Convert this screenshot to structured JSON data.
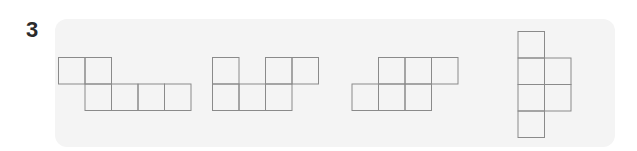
{
  "question": {
    "number": "3"
  },
  "colors": {
    "panel_background": "#f4f4f4",
    "cell_stroke": "#8a8a8a",
    "number_text": "#2b2b2b"
  },
  "cell_size": 26.5,
  "nets": [
    {
      "id": "net-1",
      "cells": [
        [
          0,
          0
        ],
        [
          1,
          0
        ],
        [
          1,
          1
        ],
        [
          2,
          1
        ],
        [
          3,
          1
        ],
        [
          4,
          1
        ]
      ],
      "origin": [
        58,
        57
      ]
    },
    {
      "id": "net-2",
      "cells": [
        [
          0,
          0
        ],
        [
          2,
          0
        ],
        [
          3,
          0
        ],
        [
          0,
          1
        ],
        [
          1,
          1
        ],
        [
          2,
          1
        ]
      ],
      "origin": [
        212,
        57
      ]
    },
    {
      "id": "net-3",
      "cells": [
        [
          1,
          0
        ],
        [
          2,
          0
        ],
        [
          3,
          0
        ],
        [
          0,
          1
        ],
        [
          1,
          1
        ],
        [
          2,
          1
        ]
      ],
      "origin": [
        351.5,
        57
      ]
    },
    {
      "id": "net-4",
      "cells": [
        [
          0,
          0
        ],
        [
          0,
          1
        ],
        [
          1,
          1
        ],
        [
          0,
          2
        ],
        [
          1,
          2
        ],
        [
          0,
          3
        ]
      ],
      "origin": [
        517.5,
        31
      ]
    }
  ]
}
